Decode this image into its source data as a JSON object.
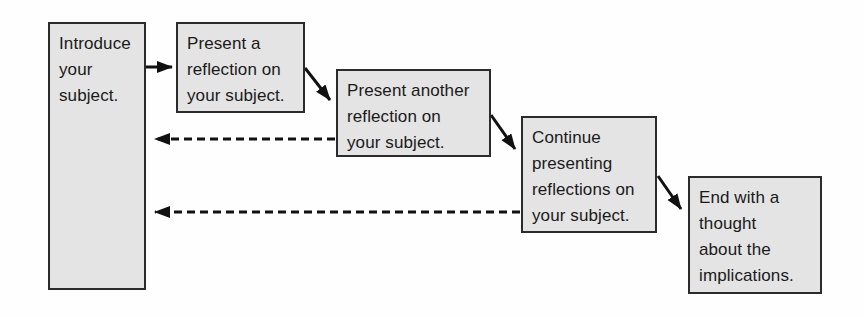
{
  "diagram": {
    "type": "flowchart",
    "background_color": "#fefefe",
    "box_fill_color": "#e4e4e4",
    "box_border_color": "#2b2b2b",
    "text_color": "#1a1a1a",
    "arrow_color": "#111111",
    "boxes": [
      {
        "id": "introduce",
        "lines": [
          "Introduce",
          "your",
          "subject."
        ]
      },
      {
        "id": "first-reflection",
        "lines": [
          "Present a",
          "reflection on",
          "your subject."
        ]
      },
      {
        "id": "another-reflection",
        "lines": [
          "Present another",
          "reflection on",
          "your subject."
        ]
      },
      {
        "id": "continue",
        "lines": [
          "Continue",
          "presenting",
          "reflections on",
          "your subject."
        ]
      },
      {
        "id": "end",
        "lines": [
          "End with a",
          "thought",
          "about the",
          "implications."
        ]
      }
    ],
    "arrows": [
      {
        "from": "introduce",
        "to": "first-reflection",
        "style": "solid"
      },
      {
        "from": "first-reflection",
        "to": "another-reflection",
        "style": "solid"
      },
      {
        "from": "another-reflection",
        "to": "continue",
        "style": "solid"
      },
      {
        "from": "continue",
        "to": "end",
        "style": "solid"
      },
      {
        "from": "another-reflection",
        "to": "introduce",
        "style": "dashed"
      },
      {
        "from": "continue",
        "to": "introduce",
        "style": "dashed"
      }
    ]
  }
}
